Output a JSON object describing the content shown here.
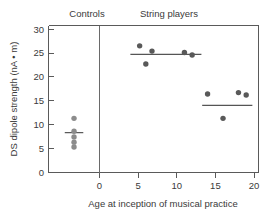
{
  "chart_data": {
    "type": "scatter",
    "title": "",
    "xlabel": "Age at inception of musical practice",
    "ylabel": "DS dipole strength (nA • m)",
    "xlim": [
      -5,
      21.5
    ],
    "ylim": [
      0,
      31
    ],
    "xticks": [
      0,
      5,
      10,
      15,
      20
    ],
    "xtick_labels": [
      "0",
      "5",
      "10",
      "15",
      "20"
    ],
    "yticks": [
      0,
      5,
      10,
      15,
      20,
      25,
      30
    ],
    "ytick_labels": [
      "0",
      "5",
      "10",
      "15",
      "20",
      "25",
      "30"
    ],
    "grid": false,
    "legend": false,
    "group_labels": [
      "Controls",
      "String players"
    ],
    "divider_x": 0,
    "series": [
      {
        "name": "Controls",
        "marker_color": "#8c8c8c",
        "points": [
          {
            "x": -3.3,
            "y": 11.3
          },
          {
            "x": -3.3,
            "y": 8.6
          },
          {
            "x": -3.3,
            "y": 7.4
          },
          {
            "x": -3.3,
            "y": 6.3
          },
          {
            "x": -3.3,
            "y": 5.3
          }
        ],
        "mean": 8.3,
        "mean_line_x": [
          -4.5,
          -2.1
        ]
      },
      {
        "name": "String players (early inception)",
        "marker_color": "#595959",
        "points": [
          {
            "x": 5.2,
            "y": 26.5
          },
          {
            "x": 6.0,
            "y": 22.7
          },
          {
            "x": 6.8,
            "y": 25.4
          },
          {
            "x": 11.0,
            "y": 25.1
          },
          {
            "x": 12.0,
            "y": 24.6
          }
        ],
        "mean": 24.7,
        "mean_line_x": [
          4.0,
          13.2
        ]
      },
      {
        "name": "String players (late inception)",
        "marker_color": "#595959",
        "points": [
          {
            "x": 14.0,
            "y": 16.4
          },
          {
            "x": 16.0,
            "y": 11.3
          },
          {
            "x": 18.0,
            "y": 16.7
          },
          {
            "x": 19.0,
            "y": 16.2
          }
        ],
        "mean": 14.0,
        "mean_line_x": [
          13.3,
          19.8
        ]
      }
    ]
  },
  "axes": {
    "y_title": "DS dipole strength (nA • m)",
    "x_title": "Age at inception of musical practice",
    "y_labels": {
      "t0": "0",
      "t5": "5",
      "t10": "10",
      "t15": "15",
      "t20": "20",
      "t25": "25",
      "t30": "30"
    },
    "x_labels": {
      "t0": "0",
      "t5": "5",
      "t10": "10",
      "t15": "15",
      "t20": "20"
    }
  },
  "groups": {
    "controls_label": "Controls",
    "string_players_label": "String players"
  }
}
